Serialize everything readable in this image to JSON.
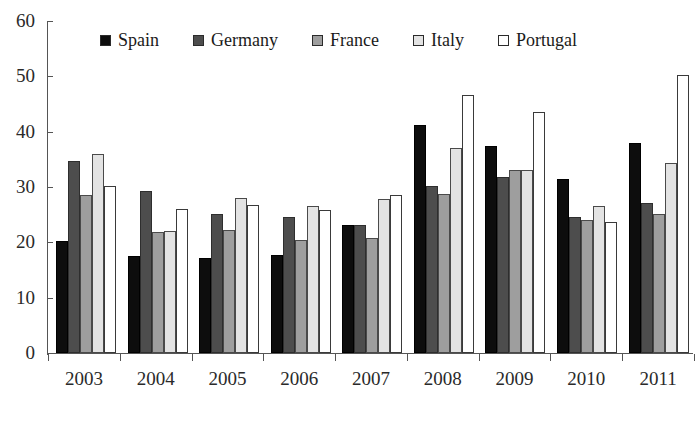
{
  "chart_data": {
    "type": "bar",
    "title": "",
    "subtitle": "",
    "xlabel": "",
    "ylabel": "",
    "ylim": [
      0,
      60
    ],
    "yticks": [
      0,
      10,
      20,
      30,
      40,
      50,
      60
    ],
    "ytick_labels": [
      "0",
      "10",
      "20",
      "30",
      "40",
      "50",
      "60"
    ],
    "grid": false,
    "legend_position": "top-inside",
    "categories": [
      "2003",
      "2004",
      "2005",
      "2006",
      "2007",
      "2008",
      "2009",
      "2010",
      "2011"
    ],
    "series": [
      {
        "name": "Spain",
        "color": "#0d0d0d",
        "values": [
          20.2,
          17.5,
          17.2,
          17.8,
          23.2,
          41.2,
          37.4,
          31.5,
          38.0
        ]
      },
      {
        "name": "Germany",
        "color": "#4d4d4d",
        "values": [
          34.7,
          29.3,
          25.2,
          24.6,
          23.2,
          30.2,
          31.9,
          24.5,
          27.2
        ]
      },
      {
        "name": "France",
        "color": "#9e9e9e",
        "values": [
          28.6,
          21.9,
          22.2,
          20.4,
          20.8,
          28.8,
          33.0,
          24.0,
          25.1
        ]
      },
      {
        "name": "Italy",
        "color": "#e3e3e3",
        "values": [
          36.0,
          22.0,
          28.0,
          26.5,
          27.8,
          37.0,
          33.0,
          26.5,
          34.3
        ]
      },
      {
        "name": "Portugal",
        "color": "#ffffff",
        "values": [
          30.2,
          26.0,
          26.8,
          25.8,
          28.5,
          46.7,
          43.5,
          23.7,
          50.2
        ]
      }
    ]
  },
  "legend": {
    "items": [
      {
        "label": "Spain"
      },
      {
        "label": "Germany"
      },
      {
        "label": "France"
      },
      {
        "label": "Italy"
      },
      {
        "label": "Portugal"
      }
    ]
  }
}
